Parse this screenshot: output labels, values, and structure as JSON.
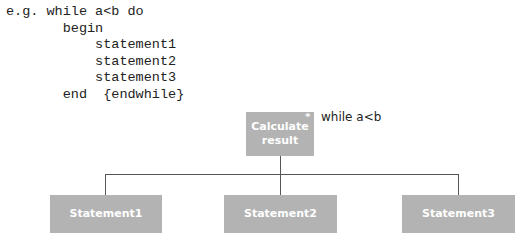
{
  "code": {
    "lines": [
      "e.g. while a<b do",
      "       begin",
      "           statement1",
      "           statement2",
      "           statement3",
      "       end  {endwhile}"
    ]
  },
  "diagram": {
    "root": {
      "label_line1": "Calculate",
      "label_line2": "result",
      "iteration_marker": "*",
      "condition": "while a<b"
    },
    "children": [
      {
        "label": "Statement1"
      },
      {
        "label": "Statement2"
      },
      {
        "label": "Statement3"
      }
    ],
    "box_color": "#b3b3b3",
    "line_color": "#555555"
  }
}
